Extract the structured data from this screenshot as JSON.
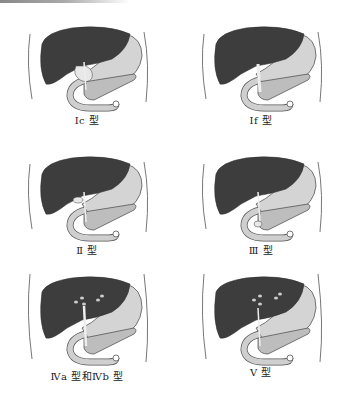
{
  "figure": {
    "panels": [
      {
        "id": "ic",
        "label": "Ⅰc 型",
        "cysts": "none",
        "duct_dilation": "cystic"
      },
      {
        "id": "if",
        "label": "Ⅰf 型",
        "cysts": "none",
        "duct_dilation": "fusiform"
      },
      {
        "id": "ii",
        "label": "Ⅱ 型",
        "cysts": "none",
        "duct_dilation": "diverticulum"
      },
      {
        "id": "iii",
        "label": "Ⅲ 型",
        "cysts": "none",
        "duct_dilation": "choledochocele"
      },
      {
        "id": "iva_ivb",
        "label": "Ⅳa 型和Ⅳb 型",
        "cysts": "intrahepatic",
        "duct_dilation": "multiple"
      },
      {
        "id": "v",
        "label": "Ⅴ 型",
        "cysts": "intrahepatic",
        "duct_dilation": "intrahepatic only"
      }
    ],
    "colors": {
      "liver": "#3d3d3d",
      "stomach": "#d4d4d4",
      "duodenum": "#cfcfcf",
      "pancreas": "#bdbdbd",
      "outline": "#555555",
      "body_wall": "#777777"
    }
  }
}
